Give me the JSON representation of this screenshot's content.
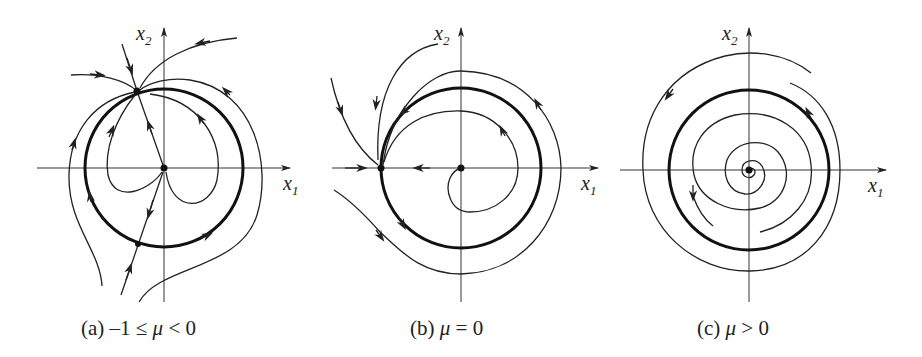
{
  "figure": {
    "panels": [
      {
        "id": "a",
        "caption_prefix": "(a) –1 ≤ ",
        "caption_mu": "μ",
        "caption_suffix": " < 0",
        "x_label": "x",
        "x_sub": "1",
        "y_label": "x",
        "y_sub": "2",
        "description": "Saddle-node pair on the circle; origin unstable"
      },
      {
        "id": "b",
        "caption_prefix": "(b) ",
        "caption_mu": "μ",
        "caption_suffix": " = 0",
        "x_label": "x",
        "x_sub": "1",
        "y_label": "x",
        "y_sub": "2",
        "description": "Single saddle-node on the circle at (-1, 0)"
      },
      {
        "id": "c",
        "caption_prefix": "(c) ",
        "caption_mu": "μ",
        "caption_suffix": " > 0",
        "x_label": "x",
        "x_sub": "1",
        "y_label": "x",
        "y_sub": "2",
        "description": "Stable limit cycle; unstable spiral at origin"
      }
    ]
  }
}
